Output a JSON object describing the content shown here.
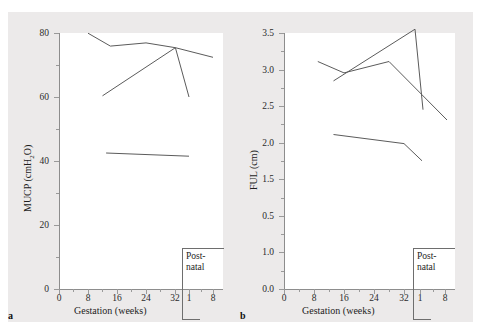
{
  "figure": {
    "background_color": "#eceaea",
    "plot_background_color": "#ffffff",
    "line_color": "#5b5b5b",
    "axis_color": "#8d8d8d"
  },
  "panels": [
    {
      "letter": "a",
      "ylabel_prefix": "MUCP (cmH",
      "ylabel_sub": "2",
      "ylabel_suffix": "O)",
      "ylabel_full": "MUCP (cmH2O)",
      "xlabel": "Gestation (weeks)",
      "yticks": [
        "80",
        "60",
        "40",
        "20",
        "0"
      ],
      "xticks": [
        "0",
        "8",
        "16",
        "24",
        "32"
      ],
      "xticks_postnatal": [
        "1",
        "8"
      ],
      "postnatal_label_line1": "Post-",
      "postnatal_label_line2": "natal"
    },
    {
      "letter": "b",
      "ylabel_prefix": "FUL (cm)",
      "ylabel_sub": "",
      "ylabel_suffix": "",
      "ylabel_full": "FUL (cm)",
      "xlabel": "Gestation (weeks)",
      "yticks": [
        "3.5",
        "3.0",
        "2.5",
        "2.0",
        "1.5",
        "0.5",
        "1.0",
        "0.0"
      ],
      "xticks": [
        "0",
        "8",
        "16",
        "24",
        "32"
      ],
      "xticks_postnatal": [
        "1",
        "8"
      ],
      "postnatal_label_line1": "Post-",
      "postnatal_label_line2": "natal"
    }
  ],
  "chart_data": [
    {
      "type": "line",
      "panel": "a",
      "title": "",
      "xlabel": "Gestation (weeks)",
      "ylabel": "MUCP (cmH2O)",
      "ylim": [
        0,
        80
      ],
      "ytick_values": [
        0,
        20,
        40,
        60,
        80
      ],
      "ytick_minor_step": 10,
      "xtick_labels": [
        "0",
        "8",
        "16",
        "24",
        "32",
        "1",
        "8"
      ],
      "xtick_kind": [
        "gestation",
        "gestation",
        "gestation",
        "gestation",
        "gestation",
        "postnatal",
        "postnatal"
      ],
      "grid": false,
      "legend": "none",
      "annotation": "Post-natal",
      "series": [
        {
          "name": "series-1",
          "points": [
            {
              "x_label": "8",
              "y": 77.5
            },
            {
              "x_label": "15",
              "y": 73.5
            },
            {
              "x_label": "26",
              "y": 74.5
            },
            {
              "x_label": "36",
              "y": 73.0
            },
            {
              "x_label": "postnatal-8",
              "y": 70.0
            }
          ]
        },
        {
          "name": "series-2",
          "points": [
            {
              "x_label": "12",
              "y": 61.0
            },
            {
              "x_label": "36",
              "y": 73.0
            }
          ]
        },
        {
          "name": "series-3",
          "points": [
            {
              "x_label": "36",
              "y": 73.0
            },
            {
              "x_label": "postnatal-1",
              "y": 60.0
            }
          ]
        },
        {
          "name": "series-4",
          "points": [
            {
              "x_label": "13",
              "y": 42.5
            },
            {
              "x_label": "postnatal-1",
              "y": 41.5
            }
          ]
        }
      ]
    },
    {
      "type": "line",
      "panel": "b",
      "title": "",
      "xlabel": "Gestation (weeks)",
      "ylabel": "FUL (cm)",
      "ylim": [
        0.0,
        3.5
      ],
      "ytick_values": [
        0.0,
        1.0,
        0.5,
        1.5,
        2.0,
        2.5,
        3.0,
        3.5
      ],
      "ytick_labels_top_to_bottom": [
        "3.5",
        "3.0",
        "2.5",
        "2.0",
        "1.5",
        "0.5",
        "1.0",
        "0.0"
      ],
      "ytick_minor_step": 0.25,
      "xtick_labels": [
        "0",
        "8",
        "16",
        "24",
        "32",
        "1",
        "8"
      ],
      "xtick_kind": [
        "gestation",
        "gestation",
        "gestation",
        "gestation",
        "gestation",
        "postnatal",
        "postnatal"
      ],
      "grid": false,
      "legend": "none",
      "annotation": "Post-natal",
      "series": [
        {
          "name": "series-1",
          "points": [
            {
              "x_label": "9",
              "y": 3.11
            },
            {
              "x_label": "16",
              "y": 3.01
            },
            {
              "x_label": "28",
              "y": 3.11
            },
            {
              "x_label": "postnatal-8",
              "y": 2.3
            }
          ]
        },
        {
          "name": "series-2",
          "points": [
            {
              "x_label": "13",
              "y": 2.94
            },
            {
              "x_label": "35",
              "y": 3.39
            },
            {
              "x_label": "postnatal-1",
              "y": 2.69
            }
          ]
        },
        {
          "name": "series-3",
          "points": [
            {
              "x_label": "13",
              "y": 2.48
            },
            {
              "x_label": "32",
              "y": 2.4
            },
            {
              "x_label": "postnatal-1",
              "y": 2.25
            }
          ]
        }
      ]
    }
  ]
}
